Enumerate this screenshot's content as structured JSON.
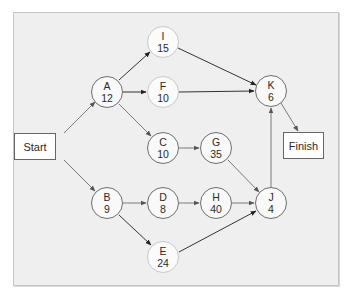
{
  "diagram": {
    "type": "activity-on-node network",
    "start": {
      "label": "Start"
    },
    "finish": {
      "label": "Finish"
    },
    "nodes": {
      "A": {
        "id": "A",
        "duration": "12"
      },
      "B": {
        "id": "B",
        "duration": "9"
      },
      "C": {
        "id": "C",
        "duration": "10"
      },
      "D": {
        "id": "D",
        "duration": "8"
      },
      "E": {
        "id": "E",
        "duration": "24"
      },
      "F": {
        "id": "F",
        "duration": "10"
      },
      "G": {
        "id": "G",
        "duration": "35"
      },
      "H": {
        "id": "H",
        "duration": "40"
      },
      "I": {
        "id": "I",
        "duration": "15"
      },
      "J": {
        "id": "J",
        "duration": "4"
      },
      "K": {
        "id": "K",
        "duration": "6"
      }
    },
    "edges": [
      [
        "Start",
        "A"
      ],
      [
        "Start",
        "B"
      ],
      [
        "A",
        "I"
      ],
      [
        "A",
        "F"
      ],
      [
        "A",
        "C"
      ],
      [
        "B",
        "D"
      ],
      [
        "B",
        "E"
      ],
      [
        "C",
        "G"
      ],
      [
        "D",
        "H"
      ],
      [
        "I",
        "K"
      ],
      [
        "F",
        "K"
      ],
      [
        "G",
        "J"
      ],
      [
        "H",
        "J"
      ],
      [
        "E",
        "J"
      ],
      [
        "J",
        "K"
      ],
      [
        "K",
        "Finish"
      ]
    ],
    "colors": {
      "panel_bg": "#efefef",
      "panel_border": "#c4c4c4",
      "node_border": "#6e6e6e",
      "node_border_light": "#c8c8c8",
      "edge": "#707070",
      "edge_dark": "#333333"
    }
  }
}
